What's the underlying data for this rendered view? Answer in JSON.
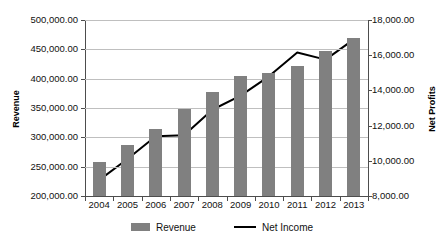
{
  "chart_data": {
    "type": "bar",
    "title": "",
    "subtitle": "",
    "xlabel": "",
    "ylabel": "Revenue",
    "y2label": "Net Profits",
    "categories": [
      "2004",
      "2005",
      "2006",
      "2007",
      "2008",
      "2009",
      "2010",
      "2011",
      "2012",
      "2013"
    ],
    "grid": true,
    "legend_position": "bottom",
    "ylim": [
      200000,
      500000
    ],
    "yticks": [
      200000,
      250000,
      300000,
      350000,
      400000,
      450000,
      500000
    ],
    "ytick_labels": [
      "200,000.00",
      "250,000.00",
      "300,000.00",
      "350,000.00",
      "400,000.00",
      "450,000.00",
      "500,000.00"
    ],
    "y2lim": [
      8000,
      18000
    ],
    "y2ticks": [
      8000,
      10000,
      12000,
      14000,
      16000,
      18000
    ],
    "y2tick_labels": [
      "8,000.00",
      "10,000.00",
      "12,000.00",
      "14,000.00",
      "16,000.00",
      "18,000.00"
    ],
    "series": [
      {
        "name": "Revenue",
        "type": "bar",
        "axis": "left",
        "color": "#808080",
        "values": [
          258000,
          287000,
          315000,
          348000,
          378000,
          405000,
          410000,
          422000,
          448000,
          470000
        ]
      },
      {
        "name": "Net Income",
        "type": "line",
        "axis": "right",
        "color": "#000000",
        "values": [
          8900,
          10100,
          11400,
          11450,
          12900,
          13700,
          14800,
          16150,
          15750,
          16900
        ]
      }
    ]
  },
  "legend": {
    "items": [
      {
        "label": "Revenue",
        "marker": "bar-swatch"
      },
      {
        "label": "Net Income",
        "marker": "line-swatch"
      }
    ]
  },
  "axes": {
    "left_title": "Revenue",
    "right_title": "Net Profits"
  }
}
